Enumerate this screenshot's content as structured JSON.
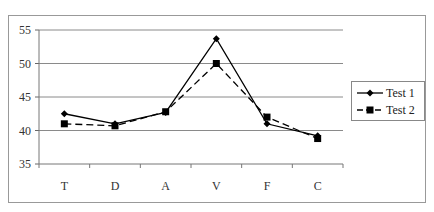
{
  "chart_data": {
    "type": "line",
    "title": "",
    "xlabel": "",
    "ylabel": "",
    "categories": [
      "T",
      "D",
      "A",
      "V",
      "F",
      "C"
    ],
    "ylim": [
      35,
      55
    ],
    "yticks": [
      35,
      40,
      45,
      50,
      55
    ],
    "grid": true,
    "legend_position": "right",
    "series": [
      {
        "name": "Test 1",
        "marker": "diamond",
        "line": "solid",
        "values": [
          42.5,
          41.0,
          42.7,
          53.7,
          41.0,
          39.2
        ]
      },
      {
        "name": "Test 2",
        "marker": "square",
        "line": "dashed",
        "values": [
          41.0,
          40.7,
          42.8,
          50.0,
          42.0,
          38.8
        ]
      }
    ]
  },
  "axis": {
    "y_labels": [
      "55",
      "50",
      "45",
      "40",
      "35"
    ],
    "x_labels": [
      "T",
      "D",
      "A",
      "V",
      "F",
      "C"
    ]
  },
  "legend": {
    "items": [
      {
        "label": "Test 1"
      },
      {
        "label": "Test 2"
      }
    ]
  }
}
